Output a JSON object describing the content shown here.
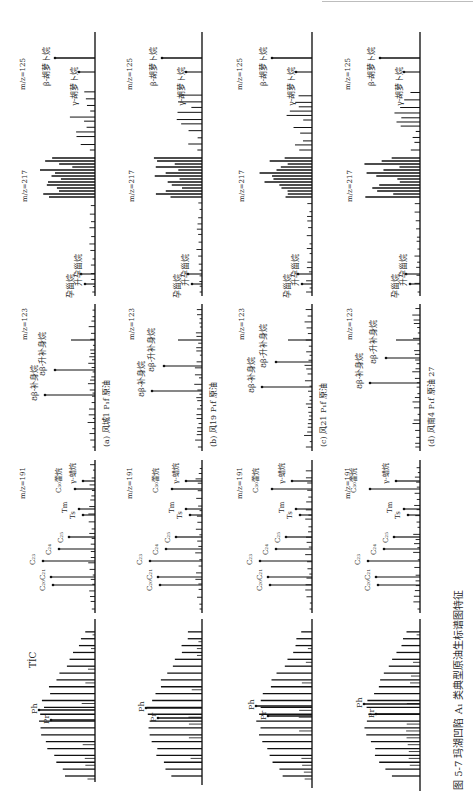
{
  "figure": {
    "caption": "图 5-7   玛湖凹陷 A₁ 类典型原油生标谱图特征",
    "panel_labels": [
      "(a) 风城1 P₁f 原油",
      "(b) 风19 P₁f 原油",
      "(c) 风21 P₁f 原油",
      "(d) 风南4 P₁f 原油 27"
    ],
    "trace_labels": [
      "TİC",
      "m/z=191",
      "m/z=123",
      "m/z=217",
      "m/z=125"
    ]
  },
  "chart_data": {
    "type": "line",
    "title": "图 5-7 玛湖凹陷 A₁ 类典型原油生标谱图特征",
    "orientation": "rotated 90° clockwise (retention time runs bottom→top)",
    "samples": [
      {
        "id": "a",
        "label": "(a) 风城1 P₁f 原油"
      },
      {
        "id": "b",
        "label": "(b) 风19 P₁f 原油"
      },
      {
        "id": "c",
        "label": "(c) 风21 P₁f 原油"
      },
      {
        "id": "d",
        "label": "(d) 风南4 P₁f 原油 27"
      }
    ],
    "traces": [
      {
        "name": "TIC",
        "annotations": [
          "Pr",
          "Ph"
        ],
        "shape": "n-alkane envelope, unimodal"
      },
      {
        "name": "m/z=191",
        "annotations": [
          "C₂₀",
          "C₂₁",
          "C₂₃",
          "C₂₄",
          "C₂₅",
          "Ts",
          "Tm",
          "C₃₀藿烷",
          "γ-蜡烷"
        ]
      },
      {
        "name": "m/z=123",
        "annotations": [
          "8β-补身烷",
          "8β-升补身烷"
        ]
      },
      {
        "name": "m/z=217",
        "annotations": [
          "孕甾烷",
          "升孕甾烷"
        ]
      },
      {
        "name": "m/z=125",
        "annotations": [
          "γ-胡萝卜烷",
          "β-胡萝卜烷"
        ]
      }
    ],
    "xlabel": "",
    "ylabel": "",
    "grid": false,
    "legend": "none"
  }
}
